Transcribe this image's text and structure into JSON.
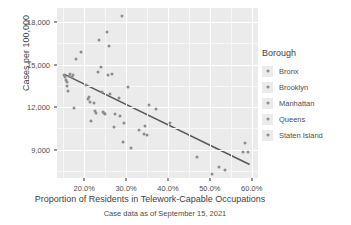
{
  "chart_data": {
    "type": "scatter",
    "title": "",
    "xlabel": "Proportion of Residents in Telework-Capable Occupations",
    "ylabel": "Cases per 100,000",
    "caption": "Case data as of September 15, 2021",
    "xlim": [
      13.5,
      61.5
    ],
    "ylim": [
      7000,
      19000
    ],
    "xticks": [
      20,
      30,
      40,
      50,
      60
    ],
    "xticklabels": [
      "20.0%",
      "30.0%",
      "40.0%",
      "50.0%",
      "60.0%"
    ],
    "yticks": [
      9000,
      12000,
      15000,
      18000
    ],
    "yticklabels": [
      "9,000",
      "12,000",
      "15,000",
      "18,000"
    ],
    "grid": true,
    "grid_minor": true,
    "legend": {
      "title": "Borough",
      "position": "right",
      "entries": [
        {
          "label": "Bronx",
          "color": "#8c8c8c"
        },
        {
          "label": "Brooklyn",
          "color": "#8c8c8c"
        },
        {
          "label": "Manhattan",
          "color": "#8c8c8c"
        },
        {
          "label": "Queens",
          "color": "#8c8c8c"
        },
        {
          "label": "Staten Island",
          "color": "#8c8c8c"
        }
      ]
    },
    "point_color": "#8c8c8c",
    "panel_background": "#ebebeb",
    "trendline": {
      "type": "linear",
      "color": "#595959",
      "x_start": 15.0,
      "y_start": 14350,
      "x_end": 59.5,
      "y_end": 7950
    },
    "points": [
      {
        "x": 15.2,
        "y": 14300
      },
      {
        "x": 15.4,
        "y": 14150
      },
      {
        "x": 15.6,
        "y": 13950
      },
      {
        "x": 15.8,
        "y": 13750
      },
      {
        "x": 15.9,
        "y": 13500
      },
      {
        "x": 16.1,
        "y": 13150
      },
      {
        "x": 16.3,
        "y": 14200
      },
      {
        "x": 16.5,
        "y": 14350
      },
      {
        "x": 17.0,
        "y": 14100
      },
      {
        "x": 17.3,
        "y": 14250
      },
      {
        "x": 17.6,
        "y": 11950
      },
      {
        "x": 18.0,
        "y": 15400
      },
      {
        "x": 19.3,
        "y": 15900
      },
      {
        "x": 20.4,
        "y": 13550
      },
      {
        "x": 20.8,
        "y": 12550
      },
      {
        "x": 21.2,
        "y": 12700
      },
      {
        "x": 21.4,
        "y": 12350
      },
      {
        "x": 21.6,
        "y": 11000
      },
      {
        "x": 22.3,
        "y": 12300
      },
      {
        "x": 22.5,
        "y": 11700
      },
      {
        "x": 22.8,
        "y": 11600
      },
      {
        "x": 23.2,
        "y": 14500
      },
      {
        "x": 23.6,
        "y": 16750
      },
      {
        "x": 24.0,
        "y": 14850
      },
      {
        "x": 24.3,
        "y": 13050
      },
      {
        "x": 24.6,
        "y": 11650
      },
      {
        "x": 24.8,
        "y": 11600
      },
      {
        "x": 25.0,
        "y": 11500
      },
      {
        "x": 25.4,
        "y": 17300
      },
      {
        "x": 25.7,
        "y": 14300
      },
      {
        "x": 26.0,
        "y": 16300
      },
      {
        "x": 26.2,
        "y": 12950
      },
      {
        "x": 26.6,
        "y": 14350
      },
      {
        "x": 27.0,
        "y": 10600
      },
      {
        "x": 27.4,
        "y": 11550
      },
      {
        "x": 28.3,
        "y": 12650
      },
      {
        "x": 28.6,
        "y": 11400
      },
      {
        "x": 29.0,
        "y": 18450
      },
      {
        "x": 29.2,
        "y": 9550
      },
      {
        "x": 29.5,
        "y": 10900
      },
      {
        "x": 30.4,
        "y": 13450
      },
      {
        "x": 31.2,
        "y": 9150
      },
      {
        "x": 33.0,
        "y": 10400
      },
      {
        "x": 34.2,
        "y": 10100
      },
      {
        "x": 34.6,
        "y": 10700
      },
      {
        "x": 34.9,
        "y": 10050
      },
      {
        "x": 35.5,
        "y": 12150
      },
      {
        "x": 37.1,
        "y": 11900
      },
      {
        "x": 40.5,
        "y": 10900
      },
      {
        "x": 47.0,
        "y": 8500
      },
      {
        "x": 50.5,
        "y": 7250
      },
      {
        "x": 52.3,
        "y": 7800
      },
      {
        "x": 53.5,
        "y": 7550
      },
      {
        "x": 57.8,
        "y": 8850
      },
      {
        "x": 58.3,
        "y": 9500
      },
      {
        "x": 59.2,
        "y": 8850
      }
    ]
  }
}
